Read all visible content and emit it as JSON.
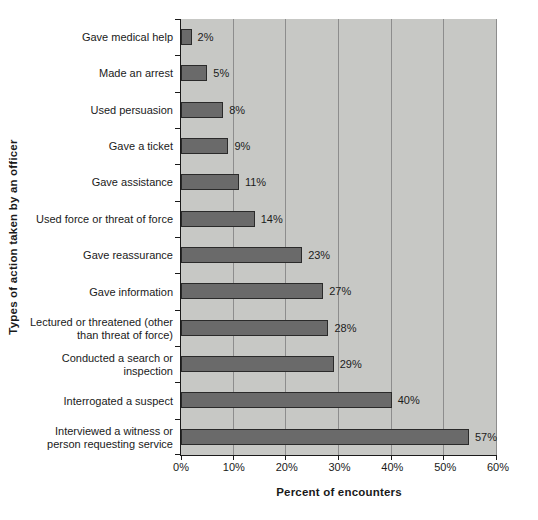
{
  "chart_data": {
    "type": "bar",
    "orientation": "horizontal",
    "xlabel": "Percent of encounters",
    "ylabel": "Types of action taken by an officer",
    "categories": [
      "Gave medical help",
      "Made an arrest",
      "Used persuasion",
      "Gave a ticket",
      "Gave assistance",
      "Used force or threat of force",
      "Gave reassurance",
      "Gave information",
      "Lectured or threatened (other than threat of force)",
      "Conducted a search or inspection",
      "Interrogated a suspect",
      "Interviewed a witness or person requesting service"
    ],
    "values": [
      2,
      5,
      8,
      9,
      11,
      14,
      23,
      27,
      28,
      29,
      40,
      57
    ],
    "value_labels": [
      "2%",
      "5%",
      "8%",
      "9%",
      "11%",
      "14%",
      "23%",
      "27%",
      "28%",
      "29%",
      "40%",
      "57%"
    ],
    "xlim": [
      0,
      60
    ],
    "x_tick_values": [
      0,
      10,
      20,
      30,
      40,
      50,
      60
    ],
    "x_tick_labels": [
      "0%",
      "10%",
      "20%",
      "30%",
      "40%",
      "50%",
      "60%"
    ],
    "grid": "vertical-only",
    "legend": "none",
    "colors": {
      "bar_fill": "#6a6a6a",
      "bar_border": "#2a2a2a",
      "plot_background": "#c7c8c5",
      "gridline": "#8d8d8d",
      "axis_line": "#1a1a1a",
      "text": "#1a1a1a",
      "page_background": "#ffffff"
    }
  }
}
